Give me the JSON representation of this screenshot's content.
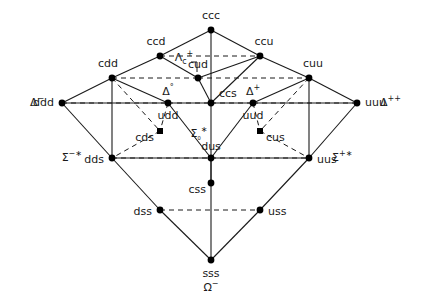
{
  "figure": {
    "type": "su4-baryon-decuplet-weight-diagram",
    "background_color": "#ffffff",
    "line_color": "#1a1a1a",
    "node_color": "#000000",
    "text_color": "#1a1a1a"
  },
  "nodes": [
    {
      "id": "ccc",
      "quark": "ccc",
      "x": 211,
      "y": 30,
      "label_dx": 0,
      "label_dy": -14,
      "anchor": "center",
      "shape": "dot"
    },
    {
      "id": "ccd",
      "quark": "ccd",
      "x": 160,
      "y": 56,
      "label_dx": -4,
      "label_dy": -14,
      "anchor": "center",
      "shape": "dot"
    },
    {
      "id": "ccu",
      "quark": "ccu",
      "x": 260,
      "y": 56,
      "label_dx": 4,
      "label_dy": -14,
      "anchor": "center",
      "shape": "dot"
    },
    {
      "id": "cdd",
      "quark": "cdd",
      "x": 112,
      "y": 78,
      "label_dx": -4,
      "label_dy": -14,
      "anchor": "center",
      "shape": "dot"
    },
    {
      "id": "cud",
      "quark": "cud",
      "x": 198,
      "y": 78,
      "label_dx": 0,
      "label_dy": -13,
      "anchor": "center",
      "shape": "dot"
    },
    {
      "id": "cuu",
      "quark": "cuu",
      "x": 309,
      "y": 78,
      "label_dx": 4,
      "label_dy": -14,
      "anchor": "center",
      "shape": "dot"
    },
    {
      "id": "ddd",
      "quark": "ddd",
      "x": 62,
      "y": 103,
      "label_dx": -8,
      "label_dy": 0,
      "anchor": "right",
      "shape": "dot"
    },
    {
      "id": "udd",
      "quark": "udd",
      "x": 168,
      "y": 103,
      "label_dx": 0,
      "label_dy": 13,
      "anchor": "center",
      "shape": "dot"
    },
    {
      "id": "ccs",
      "quark": "ccs",
      "x": 211,
      "y": 103,
      "label_dx": 8,
      "label_dy": -9,
      "anchor": "left",
      "shape": "dot"
    },
    {
      "id": "uud",
      "quark": "uud",
      "x": 253,
      "y": 103,
      "label_dx": 0,
      "label_dy": 13,
      "anchor": "center",
      "shape": "dot"
    },
    {
      "id": "uuu",
      "quark": "uuu",
      "x": 357,
      "y": 103,
      "label_dx": 8,
      "label_dy": 0,
      "anchor": "left",
      "shape": "dot"
    },
    {
      "id": "cds",
      "quark": "cds",
      "x": 160,
      "y": 131,
      "label_dx": -6,
      "label_dy": 7,
      "anchor": "right",
      "shape": "square"
    },
    {
      "id": "cus",
      "quark": "cus",
      "x": 260,
      "y": 131,
      "label_dx": 6,
      "label_dy": 7,
      "anchor": "left",
      "shape": "square"
    },
    {
      "id": "dds",
      "quark": "dds",
      "x": 112,
      "y": 158,
      "label_dx": -8,
      "label_dy": 2,
      "anchor": "right",
      "shape": "dot"
    },
    {
      "id": "dus",
      "quark": "dus",
      "x": 211,
      "y": 158,
      "label_dx": 0,
      "label_dy": -11,
      "anchor": "center",
      "shape": "dot"
    },
    {
      "id": "uus",
      "quark": "uus",
      "x": 309,
      "y": 158,
      "label_dx": 8,
      "label_dy": 2,
      "anchor": "left",
      "shape": "dot"
    },
    {
      "id": "css",
      "quark": "css",
      "x": 211,
      "y": 183,
      "label_dx": -5,
      "label_dy": 7,
      "anchor": "right",
      "shape": "dot"
    },
    {
      "id": "dss",
      "quark": "dss",
      "x": 160,
      "y": 210,
      "label_dx": -8,
      "label_dy": 2,
      "anchor": "right",
      "shape": "dot"
    },
    {
      "id": "uss",
      "quark": "uss",
      "x": 260,
      "y": 210,
      "label_dx": 8,
      "label_dy": 2,
      "anchor": "left",
      "shape": "dot"
    },
    {
      "id": "sss",
      "quark": "sss",
      "x": 211,
      "y": 260,
      "label_dx": 0,
      "label_dy": 14,
      "anchor": "center",
      "shape": "dot"
    }
  ],
  "particle_labels": [
    {
      "id": "delta-minus",
      "base": "Δ",
      "sup": "−",
      "x": 30,
      "y": 103,
      "align": "left"
    },
    {
      "id": "delta-plusplus",
      "base": "Δ",
      "sup": "++",
      "x": 380,
      "y": 103,
      "align": "left"
    },
    {
      "id": "delta-zero",
      "base": "Δ",
      "sup": "°",
      "x": 168,
      "y": 92,
      "align": "center"
    },
    {
      "id": "delta-plus",
      "base": "Δ",
      "sup": "+",
      "x": 253,
      "y": 92,
      "align": "center"
    },
    {
      "id": "sigma-minus-star",
      "base": "Σ",
      "sup": "−∗",
      "x": 82,
      "y": 158,
      "align": "right"
    },
    {
      "id": "sigma-plus-star",
      "base": "Σ",
      "sup": "+∗",
      "x": 332,
      "y": 158,
      "align": "left"
    },
    {
      "id": "sigma-zero-star",
      "base": "Σ",
      "sub": "₀",
      "sup": "∗",
      "x": 199,
      "y": 134,
      "align": "center"
    },
    {
      "id": "omega-minus",
      "base": "Ω",
      "sup": "−",
      "x": 211,
      "y": 288,
      "align": "center"
    },
    {
      "id": "lambda-c-plus",
      "base": "Λ",
      "sub": "c",
      "sup": "+",
      "x": 184,
      "y": 58,
      "align": "center"
    }
  ],
  "solid_edges": [
    [
      "ccc",
      "ccd"
    ],
    [
      "ccd",
      "cdd"
    ],
    [
      "cdd",
      "ddd"
    ],
    [
      "ccc",
      "ccu"
    ],
    [
      "ccu",
      "cuu"
    ],
    [
      "cuu",
      "uuu"
    ],
    [
      "ddd",
      "dds"
    ],
    [
      "dds",
      "dss"
    ],
    [
      "dss",
      "sss"
    ],
    [
      "uuu",
      "uus"
    ],
    [
      "uus",
      "uss"
    ],
    [
      "uss",
      "sss"
    ],
    [
      "ccc",
      "ccs"
    ],
    [
      "ccs",
      "css"
    ],
    [
      "css",
      "sss"
    ],
    [
      "ccd",
      "cud"
    ],
    [
      "cud",
      "ccs"
    ],
    [
      "ccu",
      "cud"
    ],
    [
      "ccu",
      "ccs"
    ],
    [
      "cdd",
      "udd"
    ],
    [
      "udd",
      "ccs"
    ],
    [
      "cuu",
      "uud"
    ],
    [
      "uud",
      "ccs"
    ],
    [
      "cdd",
      "dds"
    ],
    [
      "cuu",
      "uus"
    ],
    [
      "ddd",
      "udd"
    ],
    [
      "uuu",
      "uud"
    ],
    [
      "udd",
      "dus"
    ],
    [
      "dus",
      "css"
    ],
    [
      "uud",
      "dus"
    ],
    [
      "dds",
      "dus"
    ],
    [
      "uus",
      "dus"
    ]
  ],
  "dashed_edges": [
    [
      "ccd",
      "ccu"
    ],
    [
      "cdd",
      "cud"
    ],
    [
      "cud",
      "cuu"
    ],
    [
      "ddd",
      "udd"
    ],
    [
      "udd",
      "ccs"
    ],
    [
      "ccs",
      "uud"
    ],
    [
      "uud",
      "uuu"
    ],
    [
      "dds",
      "dus"
    ],
    [
      "dus",
      "uus"
    ],
    [
      "dss",
      "uss"
    ],
    [
      "cdd",
      "cds"
    ],
    [
      "cds",
      "dds"
    ],
    [
      "cuu",
      "cus"
    ],
    [
      "cus",
      "uus"
    ],
    [
      "udd",
      "cds"
    ],
    [
      "uud",
      "cus"
    ]
  ],
  "pointer": {
    "id": "lambda-c-pointer",
    "from_x": 197,
    "from_y": 62,
    "to_x": 197,
    "to_y": 72
  },
  "caption_notes": {
    "description": "SU(4) weight diagram for spin-3/2 baryon multiplet (decuplet) with charm; lattice nodes labelled by quark content."
  }
}
